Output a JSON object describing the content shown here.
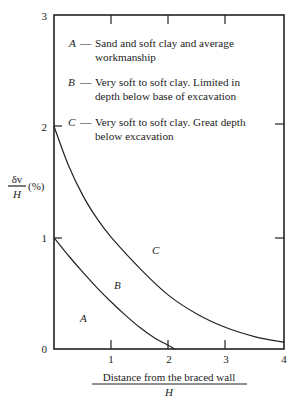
{
  "chart_data": {
    "type": "line",
    "title": "",
    "xlabel": "Distance from the braced wall / H",
    "xlabel_numerator": "Distance from the braced wall",
    "xlabel_denominator": "H",
    "ylabel": "δv / H (%)",
    "ylabel_numerator": "δv",
    "ylabel_denominator": "H",
    "ylabel_unit": "(%)",
    "xlim": [
      0,
      4
    ],
    "ylim": [
      0,
      3
    ],
    "x_ticks": [
      "1",
      "2",
      "3",
      "4"
    ],
    "y_ticks": [
      "0",
      "1",
      "2",
      "3"
    ],
    "grid": false,
    "series": [
      {
        "name": "Boundary A/B",
        "x": [
          0,
          0.25,
          0.5,
          0.75,
          1.0,
          1.25,
          1.5,
          1.75,
          2.0,
          2.1
        ],
        "values": [
          1.0,
          0.84,
          0.69,
          0.55,
          0.42,
          0.3,
          0.19,
          0.1,
          0.03,
          0.0
        ]
      },
      {
        "name": "Boundary B/C",
        "x": [
          0,
          0.25,
          0.5,
          0.75,
          1.0,
          1.5,
          2.0,
          2.5,
          3.0,
          3.5,
          4.0
        ],
        "values": [
          2.0,
          1.65,
          1.38,
          1.17,
          1.0,
          0.72,
          0.48,
          0.31,
          0.19,
          0.11,
          0.06
        ]
      }
    ],
    "zone_labels": [
      {
        "label": "A",
        "x": 0.5,
        "y": 0.28
      },
      {
        "label": "B",
        "x": 1.12,
        "y": 0.57
      },
      {
        "label": "C",
        "x": 1.8,
        "y": 0.9
      }
    ],
    "legend": [
      {
        "key": "A",
        "lines": [
          "Sand and soft clay and average",
          "workmanship"
        ]
      },
      {
        "key": "B",
        "lines": [
          "Very soft to soft clay. Limited in",
          "depth below base of excavation"
        ]
      },
      {
        "key": "C",
        "lines": [
          "Very soft to soft clay. Great depth",
          "below excavation"
        ]
      }
    ],
    "legend_position": "upper-left inside plot"
  }
}
